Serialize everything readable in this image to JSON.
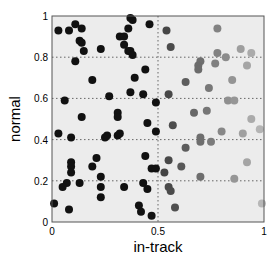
{
  "chart_data": {
    "type": "scatter",
    "title": "",
    "xlabel": "in-track",
    "ylabel": "normal",
    "xlim": [
      0,
      1
    ],
    "ylim": [
      0,
      1
    ],
    "grid": {
      "x": [
        0.5
      ],
      "y": [
        0.2,
        0.4,
        0.6,
        0.8
      ],
      "style": "dotted"
    },
    "legend": null,
    "xticks": [
      {
        "value": 0,
        "label": "0"
      },
      {
        "value": 0.5,
        "label": "0.5"
      },
      {
        "value": 1,
        "label": "1"
      }
    ],
    "yticks": [
      {
        "value": 0,
        "label": "0"
      },
      {
        "value": 0.2,
        "label": "0.2"
      },
      {
        "value": 0.4,
        "label": "0.4"
      },
      {
        "value": 0.6,
        "label": "0.6"
      },
      {
        "value": 0.8,
        "label": "0.8"
      },
      {
        "value": 1,
        "label": "1"
      }
    ],
    "color_encoding": "grayscale by in-track position: black for x<0.5, lightening toward x=1",
    "colors": {
      "plot_background": "#ececec",
      "dark_point": "#111111",
      "light_point": "#bdbdbd",
      "frame": "#555555"
    },
    "points": [
      [
        0.03,
        0.93
      ],
      [
        0.08,
        0.93
      ],
      [
        0.11,
        0.96
      ],
      [
        0.14,
        0.94
      ],
      [
        0.13,
        0.88
      ],
      [
        0.14,
        0.87
      ],
      [
        0.15,
        0.83
      ],
      [
        0.23,
        0.84
      ],
      [
        0.11,
        0.78
      ],
      [
        0.19,
        0.69
      ],
      [
        0.37,
        0.99
      ],
      [
        0.38,
        0.98
      ],
      [
        0.36,
        0.94
      ],
      [
        0.32,
        0.9
      ],
      [
        0.34,
        0.9
      ],
      [
        0.34,
        0.86
      ],
      [
        0.36,
        0.83
      ],
      [
        0.37,
        0.83
      ],
      [
        0.38,
        0.81
      ],
      [
        0.46,
        0.96
      ],
      [
        0.44,
        0.74
      ],
      [
        0.39,
        0.7
      ],
      [
        0.06,
        0.59
      ],
      [
        0.27,
        0.61
      ],
      [
        0.37,
        0.63
      ],
      [
        0.43,
        0.62
      ],
      [
        0.49,
        0.58
      ],
      [
        0.14,
        0.51
      ],
      [
        0.31,
        0.53
      ],
      [
        0.31,
        0.51
      ],
      [
        0.45,
        0.48
      ],
      [
        0.03,
        0.43
      ],
      [
        0.09,
        0.41
      ],
      [
        0.25,
        0.41
      ],
      [
        0.26,
        0.42
      ],
      [
        0.31,
        0.42
      ],
      [
        0.32,
        0.43
      ],
      [
        0.49,
        0.44
      ],
      [
        0.09,
        0.29
      ],
      [
        0.09,
        0.27
      ],
      [
        0.09,
        0.24
      ],
      [
        0.07,
        0.19
      ],
      [
        0.05,
        0.17
      ],
      [
        0.13,
        0.19
      ],
      [
        0.21,
        0.31
      ],
      [
        0.19,
        0.27
      ],
      [
        0.23,
        0.22
      ],
      [
        0.23,
        0.17
      ],
      [
        0.23,
        0.12
      ],
      [
        0.34,
        0.17
      ],
      [
        0.01,
        0.09
      ],
      [
        0.08,
        0.06
      ],
      [
        0.44,
        0.32
      ],
      [
        0.47,
        0.26
      ],
      [
        0.49,
        0.26
      ],
      [
        0.43,
        0.19
      ],
      [
        0.45,
        0.16
      ],
      [
        0.41,
        0.08
      ],
      [
        0.42,
        0.05
      ],
      [
        0.47,
        0.03
      ],
      [
        0.54,
        0.93
      ],
      [
        0.56,
        0.85
      ],
      [
        0.78,
        0.94
      ],
      [
        0.78,
        0.82
      ],
      [
        0.82,
        0.8
      ],
      [
        0.77,
        0.77
      ],
      [
        0.89,
        0.84
      ],
      [
        0.94,
        0.82
      ],
      [
        0.92,
        0.76
      ],
      [
        0.7,
        0.78
      ],
      [
        0.69,
        0.76
      ],
      [
        0.69,
        0.74
      ],
      [
        0.63,
        0.68
      ],
      [
        0.85,
        0.69
      ],
      [
        0.74,
        0.65
      ],
      [
        0.55,
        0.62
      ],
      [
        0.67,
        0.53
      ],
      [
        0.73,
        0.54
      ],
      [
        0.83,
        0.59
      ],
      [
        0.86,
        0.59
      ],
      [
        0.57,
        0.47
      ],
      [
        0.94,
        0.5
      ],
      [
        0.98,
        0.45
      ],
      [
        0.8,
        0.44
      ],
      [
        0.9,
        0.43
      ],
      [
        0.7,
        0.41
      ],
      [
        0.7,
        0.39
      ],
      [
        0.75,
        0.39
      ],
      [
        0.63,
        0.36
      ],
      [
        0.55,
        0.3
      ],
      [
        0.61,
        0.27
      ],
      [
        0.53,
        0.24
      ],
      [
        0.7,
        0.22
      ],
      [
        0.86,
        0.21
      ],
      [
        0.92,
        0.29
      ],
      [
        0.55,
        0.17
      ],
      [
        0.56,
        0.15
      ],
      [
        0.58,
        0.07
      ],
      [
        0.99,
        0.09
      ]
    ]
  }
}
